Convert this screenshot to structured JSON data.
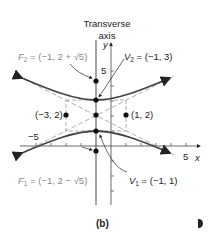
{
  "figure": {
    "caption": "(b)",
    "transverse_axis_label_line1": "Transverse",
    "transverse_axis_label_line2": "axis",
    "axis_labels": {
      "x": "x",
      "y": "y"
    },
    "tick_labels": {
      "y5": "5",
      "x5": "5",
      "xneg5": "−5"
    },
    "points": {
      "F2": {
        "name": "F",
        "sub": "2",
        "text": " = (−1, 2 + √5)"
      },
      "V2": {
        "name": "V",
        "sub": "2",
        "text": " = (−1, 3)"
      },
      "left": {
        "text": "(−3, 2)"
      },
      "right": {
        "text": "(1, 2)"
      },
      "F1": {
        "name": "F",
        "sub": "1",
        "text": " = (−1, 2 − √5)"
      },
      "V1": {
        "name": "V",
        "sub": "1",
        "text": " = (−1, 1)"
      }
    },
    "colors": {
      "ink": "#222222",
      "focus_label": "#8a8a8a",
      "dashed": "#9a9a9a"
    }
  }
}
